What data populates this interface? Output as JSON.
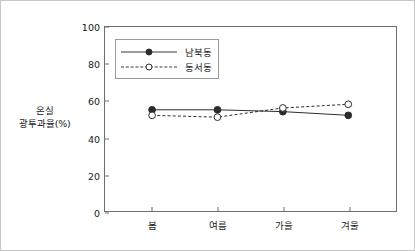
{
  "chart_data": {
    "type": "line",
    "title": "",
    "xlabel": "",
    "ylabel": "온실\n광투과율(%)",
    "ylabel_lines": [
      "온실",
      "광투과율(%)"
    ],
    "categories": [
      "봄",
      "여름",
      "가을",
      "겨울"
    ],
    "ylim": [
      0,
      100
    ],
    "yticks": [
      0,
      20,
      40,
      60,
      80,
      100
    ],
    "ytick_labels": [
      "0",
      "20",
      "40",
      "60",
      "80",
      "100"
    ],
    "grid": false,
    "legend_position": "upper left",
    "series": [
      {
        "name": "남북동",
        "values": [
          55,
          55,
          54,
          52
        ],
        "line_style": "solid",
        "marker": "filled-circle",
        "color": "#2b2b2b"
      },
      {
        "name": "동서동",
        "values": [
          52,
          51,
          56,
          58
        ],
        "line_style": "dashed",
        "marker": "open-circle",
        "color": "#2b2b2b"
      }
    ]
  },
  "figure": {
    "border_color": "#c8c8c8",
    "axis_color": "#6e6e6e",
    "text_color": "#1a1a1a"
  }
}
